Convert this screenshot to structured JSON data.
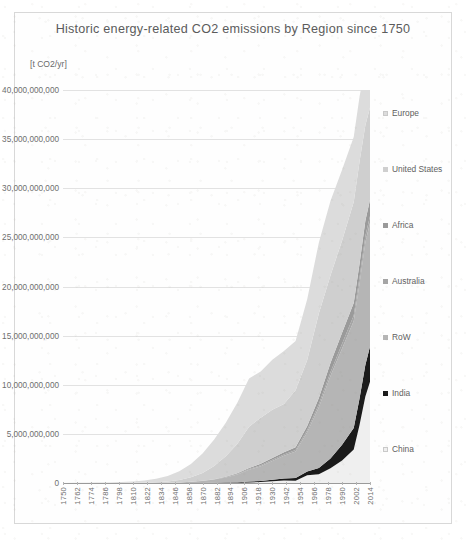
{
  "chart_data": {
    "type": "area",
    "title": "Historic energy-related CO2 emissions by Region since 1750",
    "subtitle": "",
    "ylabel": "[t CO2/yr]",
    "xlabel": "",
    "stacked": true,
    "grid": true,
    "legend_position": "right",
    "ylim": [
      0,
      40000000000
    ],
    "xlim": [
      1750,
      2014
    ],
    "ytick_labels": [
      "0",
      "5,000,000,000",
      "10,000,000,000",
      "15,000,000,000",
      "20,000,000,000",
      "25,000,000,000",
      "30,000,000,000",
      "35,000,000,000",
      "40,000,000,000"
    ],
    "ytick_values": [
      0,
      5000000000,
      10000000000,
      15000000000,
      20000000000,
      25000000000,
      30000000000,
      35000000000,
      40000000000
    ],
    "xtick_labels": [
      "1750",
      "1762",
      "1774",
      "1786",
      "1798",
      "1810",
      "1822",
      "1834",
      "1846",
      "1858",
      "1870",
      "1882",
      "1894",
      "1906",
      "1918",
      "1930",
      "1942",
      "1954",
      "1966",
      "1978",
      "1990",
      "2002",
      "2014"
    ],
    "xtick_values": [
      1750,
      1762,
      1774,
      1786,
      1798,
      1810,
      1822,
      1834,
      1846,
      1858,
      1870,
      1882,
      1894,
      1906,
      1918,
      1930,
      1942,
      1954,
      1966,
      1978,
      1990,
      2002,
      2014
    ],
    "x": [
      1750,
      1760,
      1770,
      1780,
      1790,
      1800,
      1810,
      1820,
      1830,
      1840,
      1850,
      1860,
      1870,
      1880,
      1890,
      1900,
      1910,
      1920,
      1930,
      1940,
      1950,
      1960,
      1970,
      1980,
      1990,
      2000,
      2005,
      2010,
      2014
    ],
    "series": [
      {
        "name": "China",
        "color": "#efefef",
        "values": [
          0,
          0,
          0,
          0,
          0,
          0,
          0,
          0,
          0,
          0,
          0,
          0,
          0,
          0,
          0,
          20000000,
          50000000,
          90000000,
          180000000,
          250000000,
          220000000,
          780000000,
          900000000,
          1500000000,
          2300000000,
          3400000000,
          5900000000,
          8800000000,
          10300000000
        ]
      },
      {
        "name": "India",
        "color": "#1a1a1a",
        "values": [
          0,
          0,
          0,
          0,
          0,
          0,
          0,
          0,
          0,
          0,
          0,
          5000000,
          10000000,
          20000000,
          40000000,
          60000000,
          90000000,
          120000000,
          160000000,
          220000000,
          280000000,
          390000000,
          620000000,
          1000000000,
          1600000000,
          2200000000,
          2700000000,
          3200000000,
          3600000000
        ]
      },
      {
        "name": "RoW",
        "color": "#b5b5b5",
        "values": [
          0,
          0,
          0,
          0,
          0,
          0,
          0,
          0,
          10000000,
          30000000,
          60000000,
          110000000,
          200000000,
          330000000,
          520000000,
          780000000,
          1200000000,
          1500000000,
          1900000000,
          2300000000,
          2700000000,
          4000000000,
          6200000000,
          8400000000,
          9800000000,
          10900000000,
          11700000000,
          12500000000,
          12600000000
        ]
      },
      {
        "name": "Australia",
        "color": "#a5a5a5",
        "values": [
          0,
          0,
          0,
          0,
          0,
          0,
          0,
          0,
          0,
          0,
          0,
          5000000,
          10000000,
          20000000,
          35000000,
          55000000,
          80000000,
          100000000,
          120000000,
          140000000,
          170000000,
          220000000,
          290000000,
          380000000,
          480000000,
          560000000,
          610000000,
          650000000,
          670000000
        ]
      },
      {
        "name": "Africa",
        "color": "#9a9a9a",
        "values": [
          0,
          0,
          0,
          0,
          0,
          0,
          0,
          0,
          0,
          0,
          0,
          5000000,
          10000000,
          20000000,
          40000000,
          70000000,
          110000000,
          140000000,
          190000000,
          230000000,
          280000000,
          420000000,
          650000000,
          930000000,
          1100000000,
          1250000000,
          1400000000,
          1550000000,
          1650000000
        ]
      },
      {
        "name": "United States",
        "color": "#cfcfcf",
        "values": [
          0,
          0,
          0,
          0,
          0,
          10000000,
          20000000,
          30000000,
          60000000,
          120000000,
          240000000,
          450000000,
          780000000,
          1350000000,
          2100000000,
          3000000000,
          4200000000,
          4700000000,
          4900000000,
          4900000000,
          5800000000,
          6700000000,
          8600000000,
          8900000000,
          9400000000,
          10300000000,
          10400000000,
          9700000000,
          9400000000
        ]
      },
      {
        "name": "Europe",
        "color": "#dcdcdc",
        "values": [
          10000000,
          15000000,
          25000000,
          40000000,
          60000000,
          90000000,
          140000000,
          220000000,
          350000000,
          560000000,
          900000000,
          1350000000,
          2000000000,
          2700000000,
          3400000000,
          4200000000,
          4900000000,
          4700000000,
          5100000000,
          5400000000,
          5000000000,
          6200000000,
          7200000000,
          7600000000,
          7200000000,
          6600000000,
          6600000000,
          6200000000,
          5800000000
        ]
      }
    ],
    "legend": [
      {
        "label": "Europe",
        "color": "#dcdcdc"
      },
      {
        "label": "United States",
        "color": "#cfcfcf"
      },
      {
        "label": "Africa",
        "color": "#9a9a9a"
      },
      {
        "label": "Australia",
        "color": "#a5a5a5"
      },
      {
        "label": "RoW",
        "color": "#b5b5b5"
      },
      {
        "label": "India",
        "color": "#1a1a1a"
      },
      {
        "label": "China",
        "color": "#efefef"
      }
    ]
  }
}
